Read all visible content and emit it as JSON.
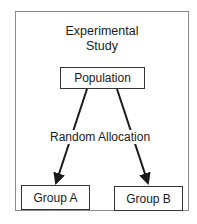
{
  "diagram": {
    "title_line1": "Experimental",
    "title_line2": "Study",
    "nodes": {
      "population": "Population",
      "group_a": "Group A",
      "group_b": "Group B"
    },
    "edge_label": "Random Allocation",
    "colors": {
      "line": "#1a1a1a",
      "border": "#8a8a8a"
    }
  }
}
